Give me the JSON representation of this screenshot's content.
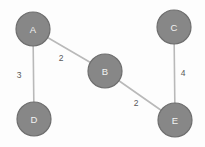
{
  "chart_data": {
    "type": "diagram",
    "diagram_kind": "weighted-undirected-graph",
    "title": "",
    "background_color": "#fdfdfd",
    "node_fill_color": "#878787",
    "node_stroke_color": "#6e6e6e",
    "node_label_color": "#f2f2f2",
    "edge_color": "#b9b9b9",
    "edge_weight_label_color": "#5a5a5a",
    "node_radius": 17,
    "nodes": [
      {
        "id": "A",
        "label": "A",
        "x": 33,
        "y": 29
      },
      {
        "id": "B",
        "label": "B",
        "x": 105,
        "y": 71
      },
      {
        "id": "C",
        "label": "C",
        "x": 174,
        "y": 27
      },
      {
        "id": "D",
        "label": "D",
        "x": 34,
        "y": 119
      },
      {
        "id": "E",
        "label": "E",
        "x": 175,
        "y": 120
      }
    ],
    "edges": [
      {
        "source": "A",
        "target": "D",
        "weight": 3,
        "label": "3",
        "label_x": 19,
        "label_y": 75
      },
      {
        "source": "A",
        "target": "B",
        "weight": 2,
        "label": "2",
        "label_x": 61,
        "label_y": 58
      },
      {
        "source": "B",
        "target": "E",
        "weight": 2,
        "label": "2",
        "label_x": 136,
        "label_y": 103
      },
      {
        "source": "C",
        "target": "E",
        "weight": 4,
        "label": "4",
        "label_x": 183,
        "label_y": 73
      }
    ]
  }
}
